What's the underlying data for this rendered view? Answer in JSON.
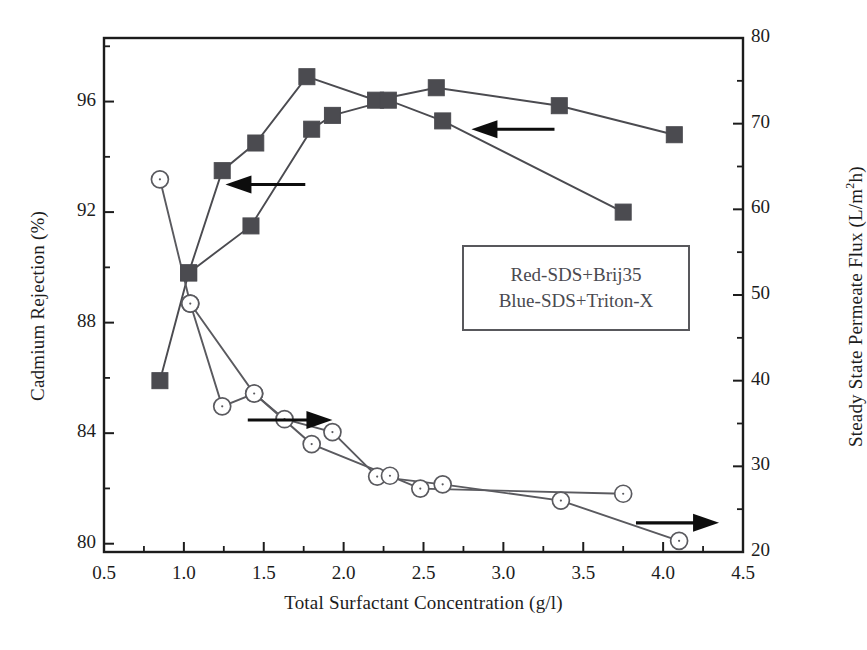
{
  "chart_data": {
    "type": "line",
    "title": "",
    "xlabel": "Total Surfactant Concentration (g/l)",
    "ylabel": "Cadmium Rejection (%)",
    "ylabel_right": "Steady State Permeate Flux (L/m2h)",
    "ylabel_right_parts": {
      "prefix": "Steady State Permeate Flux (L/m",
      "sup": "2",
      "suffix": "h)"
    },
    "xlim": [
      0.5,
      4.5
    ],
    "ylim_left": [
      79.7,
      98.3
    ],
    "ylim_right": [
      20,
      80
    ],
    "grid": false,
    "legend_position": "center-right inside plot",
    "xticks": [
      0.5,
      1.0,
      1.5,
      2.0,
      2.5,
      3.0,
      3.5,
      4.0,
      4.5
    ],
    "xtick_labels": [
      "0.5",
      "1.0",
      "1.5",
      "2.0",
      "2.5",
      "3.0",
      "3.5",
      "4.0",
      "4.5"
    ],
    "xminor_ticks": [
      0.75,
      1.25,
      1.75,
      2.25,
      2.75,
      3.25,
      3.75,
      4.25
    ],
    "yticks_left": [
      80,
      84,
      88,
      92,
      96
    ],
    "ytick_labels_left": [
      "80",
      "84",
      "88",
      "92",
      "96"
    ],
    "yminor_ticks_left": [
      82,
      86,
      90,
      94,
      98
    ],
    "yticks_right": [
      20,
      30,
      40,
      50,
      60,
      70,
      80
    ],
    "ytick_labels_right": [
      "20",
      "30",
      "40",
      "50",
      "60",
      "70",
      "80"
    ],
    "yminor_ticks_right": [
      25,
      35,
      45,
      55,
      65,
      75
    ],
    "legend": [
      "Red-SDS+Brij35",
      "Blue-SDS+Triton-X"
    ],
    "annotations": [
      {
        "name": "arrow-rejection-upper",
        "direction": "left",
        "x_from": 1.76,
        "x_to": 1.26,
        "y_left": 93.0
      },
      {
        "name": "arrow-rejection-lower",
        "direction": "left",
        "x_from": 3.32,
        "x_to": 2.8,
        "y_left": 95.0
      },
      {
        "name": "arrow-flux-left",
        "direction": "right",
        "x_from": 1.4,
        "x_to": 1.93,
        "y_right": 35.4
      },
      {
        "name": "arrow-flux-right",
        "direction": "right",
        "x_from": 3.83,
        "x_to": 4.35,
        "y_right": 23.4
      }
    ],
    "series": [
      {
        "name": "Red-SDS+Brij35 rejection",
        "axis": "left",
        "marker": "filled-square",
        "color": "#4b4b50",
        "points": [
          {
            "x": 0.85,
            "y": 85.9
          },
          {
            "x": 1.03,
            "y": 89.8
          },
          {
            "x": 1.24,
            "y": 93.5
          },
          {
            "x": 1.45,
            "y": 94.5
          },
          {
            "x": 1.77,
            "y": 96.9
          },
          {
            "x": 2.2,
            "y": 96.05
          },
          {
            "x": 2.58,
            "y": 96.5
          },
          {
            "x": 3.35,
            "y": 95.85
          },
          {
            "x": 4.07,
            "y": 94.8
          }
        ]
      },
      {
        "name": "Blue-SDS+Triton-X rejection",
        "axis": "left",
        "marker": "filled-square",
        "color": "#4b4b50",
        "points": [
          {
            "x": 1.03,
            "y": 89.8
          },
          {
            "x": 1.42,
            "y": 91.5
          },
          {
            "x": 1.8,
            "y": 95.0
          },
          {
            "x": 1.93,
            "y": 95.5
          },
          {
            "x": 2.28,
            "y": 96.05
          },
          {
            "x": 2.62,
            "y": 95.3
          },
          {
            "x": 3.75,
            "y": 92.0
          }
        ]
      },
      {
        "name": "Red-SDS+Brij35 flux",
        "axis": "right",
        "marker": "open-circle",
        "color": "#5a5a5f",
        "points": [
          {
            "x": 0.85,
            "y": 63.5
          },
          {
            "x": 1.04,
            "y": 49.0
          },
          {
            "x": 1.24,
            "y": 37.0
          },
          {
            "x": 1.44,
            "y": 38.5
          },
          {
            "x": 1.63,
            "y": 35.5
          },
          {
            "x": 1.93,
            "y": 34.0
          },
          {
            "x": 2.21,
            "y": 28.8
          },
          {
            "x": 2.62,
            "y": 27.9
          },
          {
            "x": 3.36,
            "y": 26.0
          },
          {
            "x": 4.1,
            "y": 21.3
          }
        ]
      },
      {
        "name": "Blue-SDS+Triton-X flux",
        "axis": "right",
        "marker": "open-circle",
        "color": "#5a5a5f",
        "points": [
          {
            "x": 1.04,
            "y": 49.0
          },
          {
            "x": 1.44,
            "y": 38.5
          },
          {
            "x": 1.8,
            "y": 32.6
          },
          {
            "x": 2.29,
            "y": 28.9
          },
          {
            "x": 2.48,
            "y": 27.4
          },
          {
            "x": 3.75,
            "y": 26.8
          }
        ]
      }
    ]
  }
}
